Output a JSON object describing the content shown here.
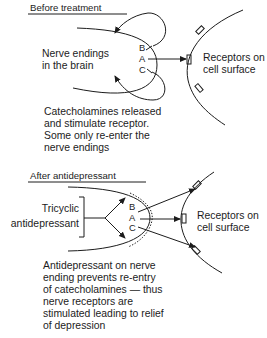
{
  "panels": [
    {
      "heading": "Before treatment",
      "nerve_label": [
        "Nerve endings",
        "in the brain"
      ],
      "site_letters": [
        "B",
        "A",
        "C"
      ],
      "receptor_label": [
        "Receptors on",
        "cell surface"
      ],
      "caption": [
        "Catecholamines released",
        "and stimulate receptor.",
        "Some only re-enter the",
        "nerve endings"
      ]
    },
    {
      "heading": "After antidepressant",
      "drug_label": [
        "Tricyclic",
        "antidepressant"
      ],
      "site_letters": [
        "B",
        "A",
        "C"
      ],
      "receptor_label": [
        "Receptors on",
        "cell surface"
      ],
      "caption": [
        "Antidepressant on nerve",
        "ending prevents re-entry",
        "of catecholamines — thus",
        "nerve receptors are",
        "stimulated leading to relief",
        "of depression"
      ]
    }
  ],
  "colors": {
    "ink": "#1c1c1c",
    "background": "#ffffff"
  }
}
